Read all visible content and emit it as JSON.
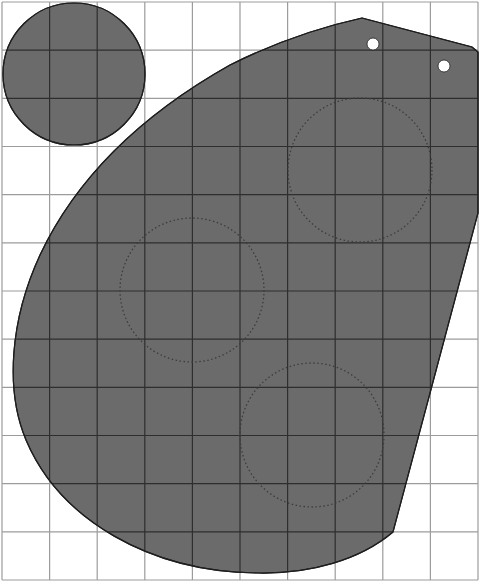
{
  "diagram": {
    "canvas": {
      "width": 480,
      "height": 585,
      "background": "#ffffff"
    },
    "grid": {
      "x_lines": [
        2,
        49.6,
        97.2,
        144.8,
        192.4,
        240,
        287.6,
        335.2,
        382.8,
        430.4,
        478
      ],
      "y_lines": [
        2,
        50.2,
        98.3,
        146.5,
        194.7,
        242.8,
        291,
        339.2,
        387.3,
        435.5,
        483.7,
        531.8,
        580
      ],
      "line_color": "#9c9c9c",
      "inner_line_color": "#2e2e2e"
    },
    "colors": {
      "fill": "#6b6b6b",
      "outline": "#1e1e1e",
      "dotted": "#3c3c3c",
      "hole": "#ffffff"
    },
    "small_circle": {
      "cx": 74,
      "cy": 74,
      "r": 71
    },
    "large_shape": {
      "path": "M362,18 L472,47 L478,52 L478,213 L393,532 C360,560 310,574 258,573 C150,572 60,520 26,440 C5,390 10,320 40,255 C80,170 150,110 230,65 C280,40 330,25 362,18 Z"
    },
    "dotted_circles": [
      {
        "cx": 360,
        "cy": 170,
        "r": 72
      },
      {
        "cx": 192,
        "cy": 290,
        "r": 72
      },
      {
        "cx": 312,
        "cy": 435,
        "r": 72
      }
    ],
    "holes": [
      {
        "cx": 373,
        "cy": 44,
        "r": 6
      },
      {
        "cx": 444,
        "cy": 66,
        "r": 6
      }
    ]
  }
}
